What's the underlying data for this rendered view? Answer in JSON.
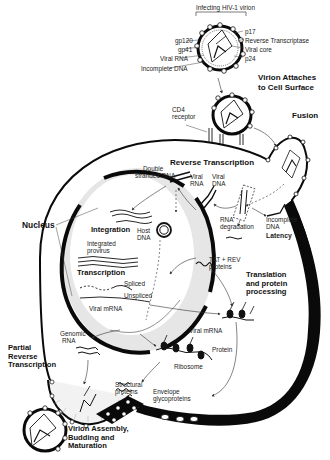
{
  "virion_labels": {
    "heading": "Infecting HIV-1 virion",
    "left": [
      "gp120",
      "gp41",
      "Viral RNA",
      "Incomplete DNA"
    ],
    "right": [
      "p17",
      "Reverse Transcriptase",
      "Viral core",
      "p24"
    ]
  },
  "stages": {
    "attach": "Virion Attaches to Cell Surface",
    "attach_line1": "Virion Attaches",
    "attach_line2": "to Cell Surface",
    "fusion": "Fusion",
    "reverse_transcription": "Reverse Transcription",
    "nucleus": "Nucleus",
    "integration": "Integration",
    "transcription": "Transcription",
    "translation_line1": "Translation",
    "translation_line2": "and protein",
    "translation_line3": "processing",
    "partial_line1": "Partial",
    "partial_line2": "Reverse",
    "partial_line3": "Transcription",
    "assembly_line1": "Virion Assembly,",
    "assembly_line2": "Budding and",
    "assembly_line3": "Maturation"
  },
  "labels": {
    "cd4_line1": "CD4",
    "cd4_line2": "receptor",
    "double_line1": "Double",
    "double_line2": "stranded DNA",
    "viral_rna_1": "Viral",
    "viral_rna_2": "RNA",
    "viral_dna_1": "Viral",
    "viral_dna_2": "DNA",
    "rna_deg_1": "RNA",
    "rna_deg_2": "degradation",
    "incomplete_1": "Incomplete",
    "incomplete_2": "DNA",
    "latency": "Latency",
    "host_dna_1": "Host",
    "host_dna_2": "DNA",
    "integrated_1": "Integrated",
    "integrated_2": "provirus",
    "spliced": "Spliced",
    "unspliced": "Unspliced",
    "viral_mrna_nuc": "Viral mRNA",
    "tat_rev_1": "TAT + REV",
    "tat_rev_2": "proteins",
    "genomic_1": "Genomic",
    "genomic_2": "RNA",
    "viral_mrna_cyto": "Viral mRNA",
    "protein": "Protein",
    "ribosome": "Ribosome",
    "structural_1": "Structural",
    "structural_2": "proteins",
    "envelope_1": "Envelope",
    "envelope_2": "glycoproteins"
  },
  "colors": {
    "ink": "#111111",
    "membrane": "#0a0a0a",
    "nucleus_fill": "#e6e6e6",
    "background": "#ffffff"
  }
}
